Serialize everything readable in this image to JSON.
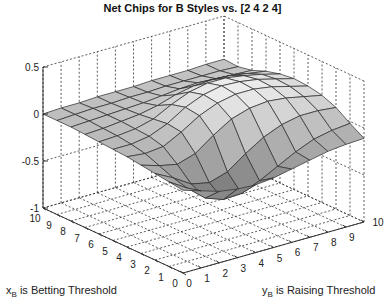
{
  "chart_data": {
    "type": "surface",
    "title": "Net Chips for B Styles vs. [2  4  2  4]",
    "xlabel": "x_B is Betting Threshold",
    "xlabel_main": "x",
    "xlabel_sub": "B",
    "xlabel_rest": " is Betting Threshold",
    "ylabel": "y_B is Raising Threshold",
    "ylabel_main": "y",
    "ylabel_sub": "B",
    "ylabel_rest": " is Raising Threshold",
    "zlabel": "",
    "x_ticks": [
      0,
      1,
      2,
      3,
      4,
      5,
      6,
      7,
      8,
      9,
      10
    ],
    "y_ticks": [
      0,
      1,
      2,
      3,
      4,
      5,
      6,
      7,
      8,
      9,
      10
    ],
    "z_ticks": [
      -1,
      -0.5,
      0,
      0.5
    ],
    "z_tick_labels": [
      "-1",
      "-0.5",
      "0",
      "0.5"
    ],
    "xlim": [
      0,
      10
    ],
    "ylim": [
      0,
      10
    ],
    "zlim": [
      -1,
      0.5
    ],
    "grid": true,
    "colormap": "gray",
    "z_grid_note": "z[x][y], x = Betting Threshold 0..10, y = Raising Threshold 0..10 (approximate readings)",
    "z": [
      [
        -0.12,
        -0.18,
        -0.24,
        -0.27,
        -0.28,
        -0.26,
        -0.22,
        -0.18,
        -0.14,
        -0.12,
        -0.11
      ],
      [
        -0.1,
        -0.22,
        -0.38,
        -0.45,
        -0.44,
        -0.36,
        -0.26,
        -0.16,
        -0.08,
        -0.04,
        -0.02
      ],
      [
        -0.08,
        -0.18,
        -0.3,
        -0.34,
        -0.28,
        -0.14,
        -0.02,
        0.06,
        0.1,
        0.1,
        0.08
      ],
      [
        -0.06,
        -0.12,
        -0.16,
        -0.1,
        0.04,
        0.16,
        0.22,
        0.24,
        0.22,
        0.18,
        0.14
      ],
      [
        -0.04,
        -0.06,
        -0.04,
        0.06,
        0.18,
        0.26,
        0.3,
        0.3,
        0.27,
        0.22,
        0.17
      ],
      [
        -0.03,
        -0.03,
        0.0,
        0.08,
        0.2,
        0.28,
        0.32,
        0.31,
        0.28,
        0.23,
        0.18
      ],
      [
        -0.02,
        -0.01,
        0.01,
        0.06,
        0.16,
        0.24,
        0.28,
        0.28,
        0.25,
        0.21,
        0.16
      ],
      [
        -0.01,
        0.0,
        0.02,
        0.04,
        0.08,
        0.14,
        0.18,
        0.19,
        0.18,
        0.15,
        0.12
      ],
      [
        0.0,
        0.01,
        0.02,
        0.03,
        0.04,
        0.06,
        0.08,
        0.09,
        0.08,
        0.07,
        0.06
      ],
      [
        0.0,
        0.01,
        0.02,
        0.02,
        0.03,
        0.03,
        0.04,
        0.04,
        0.04,
        0.04,
        0.03
      ],
      [
        0.0,
        0.01,
        0.01,
        0.02,
        0.02,
        0.02,
        0.03,
        0.03,
        0.03,
        0.04,
        0.04
      ]
    ]
  },
  "colors": {
    "surface_light": "#f4f4f4",
    "surface_dark": "#6e6e6e",
    "edge": "#2a2a2a",
    "grid": "#333333",
    "axis": "#222222"
  }
}
